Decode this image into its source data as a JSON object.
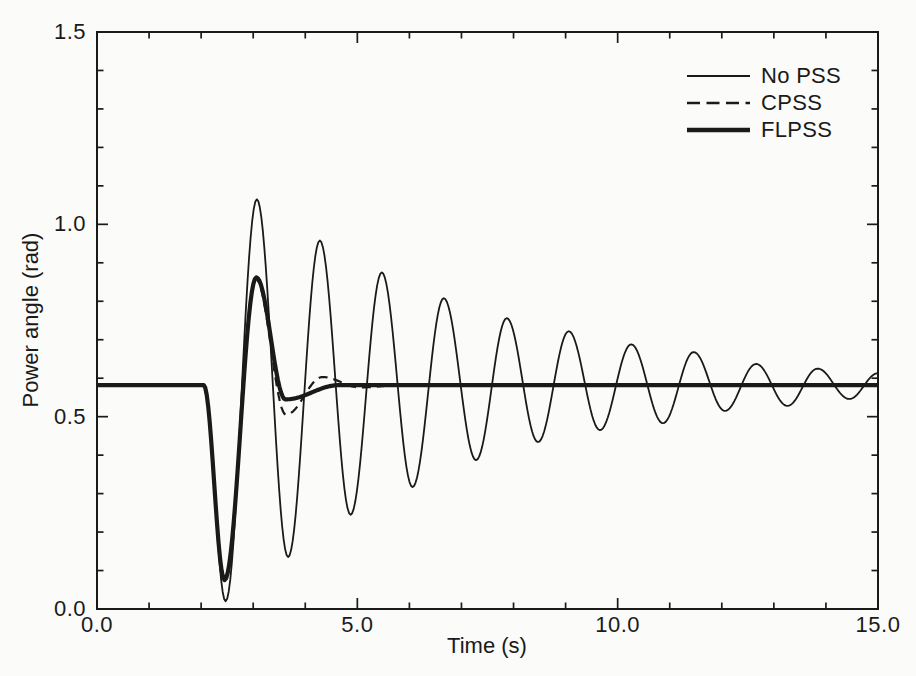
{
  "figure": {
    "background": "#fbfbf9",
    "ink": "#1a1a1a"
  },
  "chart_data": {
    "type": "line",
    "title": "",
    "xlabel": "Time (s)",
    "ylabel": "Power angle (rad)",
    "xlim": [
      0,
      15
    ],
    "ylim": [
      0,
      1.5
    ],
    "x_major_ticks": [
      0,
      5,
      10,
      15
    ],
    "x_tick_labels": [
      "0.0",
      "5.0",
      "10.0",
      "15.0"
    ],
    "x_minor_step": 1,
    "y_major_ticks": [
      0,
      0.5,
      1.0,
      1.5
    ],
    "y_tick_labels": [
      "0.0",
      "0.5",
      "1.0",
      "1.5"
    ],
    "y_minor_step": 0.1,
    "grid": false,
    "ticks": "inward-all-four-sides",
    "legend_position": "top-right",
    "steady_state_rad": 0.58,
    "fault_time_s": 2.0,
    "interpolation": "half-cosine between consecutive extrema knots [t, power_angle]",
    "series": [
      {
        "name": "No PSS",
        "style": "thin-solid",
        "stroke_width": 1.8,
        "dash": null,
        "knots": [
          [
            0.0,
            0.58
          ],
          [
            2.05,
            0.58
          ],
          [
            2.47,
            0.02
          ],
          [
            3.07,
            1.065
          ],
          [
            3.67,
            0.135
          ],
          [
            4.28,
            0.958
          ],
          [
            4.87,
            0.245
          ],
          [
            5.47,
            0.875
          ],
          [
            6.06,
            0.317
          ],
          [
            6.66,
            0.808
          ],
          [
            7.28,
            0.387
          ],
          [
            7.87,
            0.756
          ],
          [
            8.47,
            0.434
          ],
          [
            9.06,
            0.722
          ],
          [
            9.66,
            0.465
          ],
          [
            10.26,
            0.688
          ],
          [
            10.87,
            0.483
          ],
          [
            11.46,
            0.668
          ],
          [
            12.06,
            0.515
          ],
          [
            12.66,
            0.637
          ],
          [
            13.26,
            0.528
          ],
          [
            13.84,
            0.625
          ],
          [
            14.45,
            0.546
          ],
          [
            15.0,
            0.613
          ]
        ]
      },
      {
        "name": "CPSS",
        "style": "dashed",
        "stroke_width": 2.2,
        "dash": [
          9,
          6
        ],
        "knots": [
          [
            0.0,
            0.582
          ],
          [
            2.05,
            0.582
          ],
          [
            2.45,
            0.08
          ],
          [
            3.05,
            0.858
          ],
          [
            3.63,
            0.505
          ],
          [
            4.33,
            0.603
          ],
          [
            5.05,
            0.576
          ],
          [
            5.85,
            0.582
          ],
          [
            15.0,
            0.582
          ]
        ]
      },
      {
        "name": "FLPSS",
        "style": "thick-solid",
        "stroke_width": 4.2,
        "dash": null,
        "knots": [
          [
            0.0,
            0.582
          ],
          [
            2.05,
            0.582
          ],
          [
            2.45,
            0.075
          ],
          [
            3.06,
            0.862
          ],
          [
            3.62,
            0.545
          ],
          [
            4.65,
            0.582
          ],
          [
            15.0,
            0.582
          ]
        ]
      }
    ]
  }
}
